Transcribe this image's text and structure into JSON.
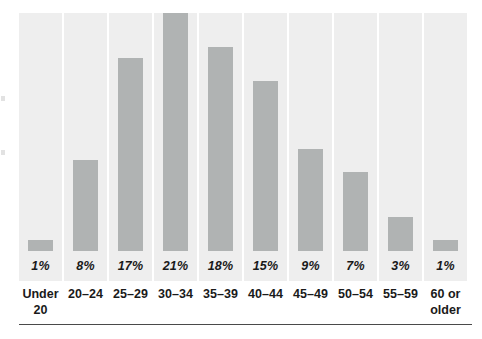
{
  "figure": {
    "background_color": "#ffffff",
    "panel_color": "#eeeeee",
    "bar_color": "#b0b3b3",
    "rule_color": "#4a4a4a",
    "text_color": "#1a1a1a"
  },
  "chart_data": {
    "type": "bar",
    "title": "",
    "subtitle": "",
    "xlabel": "",
    "ylabel": "",
    "grid": false,
    "legend": "none",
    "ylim": [
      0,
      21
    ],
    "value_suffix": "%",
    "categories": [
      "Under\n20",
      "20–24",
      "25–29",
      "30–34",
      "35–39",
      "40–44",
      "45–49",
      "50–54",
      "55–59",
      "60 or\nolder"
    ],
    "values": [
      1,
      8,
      17,
      21,
      18,
      15,
      9,
      7,
      3,
      1
    ],
    "value_labels": [
      "1%",
      "8%",
      "17%",
      "21%",
      "18%",
      "15%",
      "9%",
      "7%",
      "3%",
      "1%"
    ]
  },
  "bars": [
    {
      "category": "Under\n20",
      "value": 1,
      "value_label": "1%"
    },
    {
      "category": "20–24",
      "value": 8,
      "value_label": "8%"
    },
    {
      "category": "25–29",
      "value": 17,
      "value_label": "17%"
    },
    {
      "category": "30–34",
      "value": 21,
      "value_label": "21%"
    },
    {
      "category": "35–39",
      "value": 18,
      "value_label": "18%"
    },
    {
      "category": "40–44",
      "value": 15,
      "value_label": "15%"
    },
    {
      "category": "45–49",
      "value": 9,
      "value_label": "9%"
    },
    {
      "category": "50–54",
      "value": 7,
      "value_label": "7%"
    },
    {
      "category": "55–59",
      "value": 3,
      "value_label": "3%"
    },
    {
      "category": "60 or\nolder",
      "value": 1,
      "value_label": "1%"
    }
  ]
}
